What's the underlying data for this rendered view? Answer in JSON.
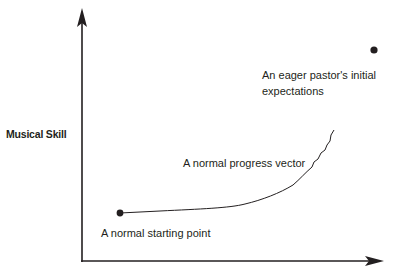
{
  "diagram": {
    "y_axis_label": "Musical Skill",
    "x_axis_label": "",
    "annotations": {
      "expectations_line1": "An eager pastor's initial",
      "expectations_line2": "expectations",
      "progress_vector": "A normal progress vector",
      "starting_point": "A normal starting point"
    },
    "points": {
      "starting_point": {
        "x": 120,
        "y": 213
      },
      "expectations_point": {
        "x": 374,
        "y": 50
      }
    },
    "colors": {
      "ink": "#231f20",
      "background": "#ffffff"
    }
  }
}
